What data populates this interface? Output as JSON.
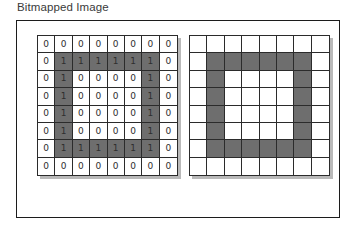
{
  "figure": {
    "title": "Bitmapped Image"
  },
  "colors": {
    "frame_border": "#1c1c1c",
    "grid_border": "#2b2b2b",
    "cell_fill": "#6e6e6e",
    "cell_empty": "#ffffff",
    "digit_text": "#2e2e2e",
    "title_text": "#3a3a3a",
    "background": "#ffffff",
    "shadow": "#b9b9b9"
  },
  "grids": {
    "values": {
      "label": "bit-value-grid",
      "rows": 8,
      "cols": 8,
      "show_digits": true,
      "data": [
        [
          0,
          0,
          0,
          0,
          0,
          0,
          0,
          0
        ],
        [
          0,
          1,
          1,
          1,
          1,
          1,
          1,
          0
        ],
        [
          0,
          1,
          0,
          0,
          0,
          0,
          1,
          0
        ],
        [
          0,
          1,
          0,
          0,
          0,
          0,
          1,
          0
        ],
        [
          0,
          1,
          0,
          0,
          0,
          0,
          1,
          0
        ],
        [
          0,
          1,
          0,
          0,
          0,
          0,
          1,
          0
        ],
        [
          0,
          1,
          1,
          1,
          1,
          1,
          1,
          0
        ],
        [
          0,
          0,
          0,
          0,
          0,
          0,
          0,
          0
        ]
      ]
    },
    "pixels": {
      "label": "rendered-pixel-grid",
      "rows": 8,
      "cols": 8,
      "show_digits": false,
      "data": [
        [
          0,
          0,
          0,
          0,
          0,
          0,
          0,
          0
        ],
        [
          0,
          1,
          1,
          1,
          1,
          1,
          1,
          0
        ],
        [
          0,
          1,
          0,
          0,
          0,
          0,
          1,
          0
        ],
        [
          0,
          1,
          0,
          0,
          0,
          0,
          1,
          0
        ],
        [
          0,
          1,
          0,
          0,
          0,
          0,
          1,
          0
        ],
        [
          0,
          1,
          0,
          0,
          0,
          0,
          1,
          0
        ],
        [
          0,
          1,
          1,
          1,
          1,
          1,
          1,
          0
        ],
        [
          0,
          0,
          0,
          0,
          0,
          0,
          0,
          0
        ]
      ]
    }
  }
}
